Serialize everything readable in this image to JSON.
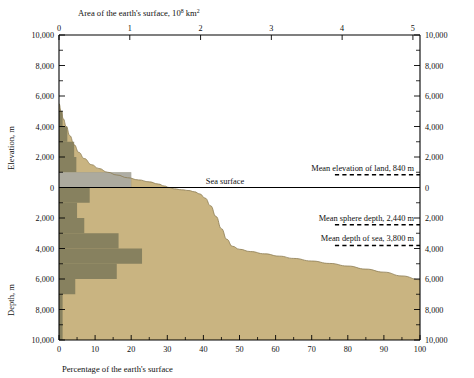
{
  "chart_data": {
    "type": "area",
    "title": "",
    "top_axis": {
      "label_prefix": "Area of the earth's surface, 10",
      "label_exponent": "8",
      "label_suffix": " km",
      "label_suffix_exponent": "2",
      "full_label": "Area of the earth's surface, 10^8 km^2",
      "ticks": [
        "0",
        "1",
        "2",
        "3",
        "4",
        "5"
      ],
      "values": [
        0,
        1,
        2,
        3,
        4,
        5
      ],
      "range": [
        0,
        5.1
      ]
    },
    "bottom_axis": {
      "label": "Percentage of the earth's surface",
      "ticks": [
        "0",
        "10",
        "20",
        "30",
        "40",
        "50",
        "60",
        "70",
        "80",
        "90",
        "100"
      ],
      "values": [
        0,
        10,
        20,
        30,
        40,
        50,
        60,
        70,
        80,
        90,
        100
      ],
      "range": [
        0,
        100
      ]
    },
    "left_axis": {
      "upper_label": "Elevation, m",
      "lower_label": "Depth, m",
      "ticks": [
        "10,000",
        "8,000",
        "6,000",
        "4,000",
        "2,000",
        "0",
        "2,000",
        "4,000",
        "6,000",
        "8,000",
        "10,000"
      ],
      "values": [
        10000,
        8000,
        6000,
        4000,
        2000,
        0,
        -2000,
        -4000,
        -6000,
        -8000,
        -10000
      ],
      "range": [
        -10000,
        10000
      ]
    },
    "right_axis": {
      "ticks": [
        "10,000",
        "8,000",
        "6,000",
        "4,000",
        "2,000",
        "0",
        "2,000",
        "4,000",
        "6,000",
        "8,000",
        "10,000"
      ],
      "values": [
        10000,
        8000,
        6000,
        4000,
        2000,
        0,
        -2000,
        -4000,
        -6000,
        -8000,
        -10000
      ]
    },
    "xlabel": "Percentage of the earth's surface",
    "ylabel": "Elevation, m / Depth, m",
    "ylim": [
      -10000,
      10000
    ],
    "xlim": [
      0,
      100
    ],
    "grid": false,
    "legend": "none",
    "series": [
      {
        "name": "Hypsometric curve",
        "x": [
          0,
          0.6,
          1.2,
          2.0,
          3.0,
          4.2,
          5.5,
          7.0,
          9.0,
          11.0,
          13.5,
          16.0,
          19.0,
          22.0,
          25.0,
          27.5,
          29.2,
          30.5,
          32.0,
          34.0,
          36.0,
          37.5,
          39.0,
          40.5,
          42.0,
          43.5,
          45.0,
          46.5,
          48.0,
          50.0,
          53.0,
          57.0,
          61.0,
          65.0,
          70.0,
          75.0,
          80.0,
          85.0,
          90.0,
          95.0,
          100.0
        ],
        "y": [
          5500,
          5000,
          4500,
          4000,
          3400,
          2800,
          2300,
          1900,
          1500,
          1250,
          1000,
          820,
          640,
          500,
          370,
          230,
          100,
          0,
          -90,
          -150,
          -200,
          -280,
          -420,
          -700,
          -1200,
          -1900,
          -2700,
          -3400,
          -3850,
          -4050,
          -4200,
          -4350,
          -4500,
          -4650,
          -4820,
          -4980,
          -5150,
          -5350,
          -5550,
          -5800,
          -6050
        ]
      }
    ],
    "histogram": {
      "name": "Frequency distribution of elevation",
      "fill_color": "#7d7a5a",
      "bars": [
        {
          "band_top": 5000,
          "band_bottom": 4000,
          "percent": 1.0
        },
        {
          "band_top": 4000,
          "band_bottom": 3000,
          "percent": 2.3
        },
        {
          "band_top": 3000,
          "band_bottom": 2000,
          "percent": 4.2
        },
        {
          "band_top": 2000,
          "band_bottom": 1000,
          "percent": 4.8
        },
        {
          "band_top": 1000,
          "band_bottom": 0,
          "percent": 20.0
        },
        {
          "band_top": 0,
          "band_bottom": -1000,
          "percent": 8.5
        },
        {
          "band_top": -1000,
          "band_bottom": -2000,
          "percent": 5.0
        },
        {
          "band_top": -2000,
          "band_bottom": -3000,
          "percent": 7.0
        },
        {
          "band_top": -3000,
          "band_bottom": -4000,
          "percent": 16.5
        },
        {
          "band_top": -4000,
          "band_bottom": -5000,
          "percent": 23.0
        },
        {
          "band_top": -5000,
          "band_bottom": -6000,
          "percent": 16.0
        },
        {
          "band_top": -6000,
          "band_bottom": -7000,
          "percent": 4.5
        },
        {
          "band_top": -7000,
          "band_bottom": -10000,
          "percent": 1.0
        }
      ]
    },
    "shelf_band": {
      "name": "Near sea level band",
      "color": "#c3c3c5",
      "top": 1000,
      "bottom": 0,
      "x_extent": 20.0
    },
    "annotations": [
      {
        "text": "Sea surface",
        "value": 0,
        "unit": "m",
        "x": 46,
        "has_dash": false
      },
      {
        "text": "Mean elevation of land, 840 m",
        "value": 840,
        "unit": "m",
        "x": 72,
        "has_dash": true
      },
      {
        "text": "Mean sphere depth, 2,440 m",
        "value": -2440,
        "unit": "m",
        "x": 72,
        "has_dash": true
      },
      {
        "text": "Mean depth of sea, 3,800 m",
        "value": -3800,
        "unit": "m",
        "x": 72,
        "has_dash": true
      }
    ],
    "colors": {
      "land_and_sea_fill": "#c9b481",
      "histogram": "#7d7a5a",
      "shelf_band": "#c3c3c5",
      "axis": "#000000",
      "background": "#ffffff"
    }
  }
}
